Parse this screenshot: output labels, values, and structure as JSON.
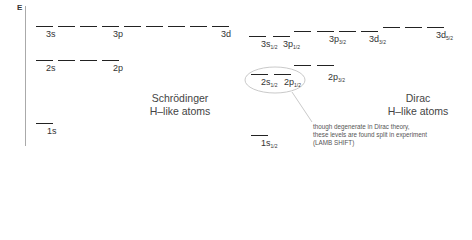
{
  "axis": {
    "label": "E"
  },
  "schrodinger": {
    "title_line1": "Schrödinger",
    "title_line2": "H–like atoms",
    "levels": [
      {
        "n": 3,
        "labels": [
          "3s",
          "3p",
          "3d"
        ]
      },
      {
        "n": 2,
        "labels": [
          "2s",
          "2p"
        ]
      },
      {
        "n": 1,
        "labels": [
          "1s"
        ]
      }
    ]
  },
  "dirac": {
    "title_line1": "Dirac",
    "title_line2": "H–like atoms",
    "labels": {
      "s3_1": "3s",
      "s3_1_sub": "1/2",
      "p3_1": "3p",
      "p3_1_sub": "1/2",
      "p3_3": "3p",
      "p3_3_sub": "3/2",
      "d3_3": "3d",
      "d3_3_sub": "3/2",
      "d3_5": "3d",
      "d3_5_sub": "5/2",
      "s2_1": "2s",
      "s2_1_sub": "1/2",
      "p2_1": "2p",
      "p2_1_sub": "1/2",
      "p2_3": "2p",
      "p2_3_sub": "3/2",
      "s1_1": "1s",
      "s1_1_sub": "1/2"
    },
    "note_line1": "though degenerate in Dirac theory,",
    "note_line2": "these levels are found split in experiment",
    "note_line3": "(LAMB SHIFT)"
  }
}
